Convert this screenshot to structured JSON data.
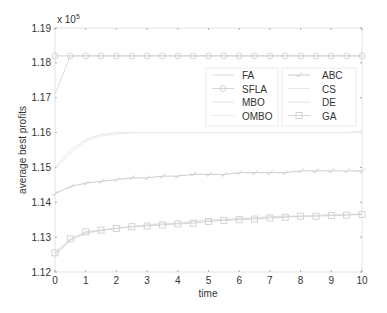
{
  "chart_data": {
    "type": "line",
    "title": "",
    "xlabel": "time",
    "ylabel": "average best profits",
    "y_exponent_label": "x 10",
    "y_exponent_power": "5",
    "xlim": [
      0,
      10
    ],
    "ylim": [
      1.12,
      1.19
    ],
    "xticks": [
      0,
      1,
      2,
      3,
      4,
      5,
      6,
      7,
      8,
      9,
      10
    ],
    "yticks": [
      1.12,
      1.13,
      1.14,
      1.15,
      1.16,
      1.17,
      1.18,
      1.19
    ],
    "ytick_labels": [
      "1.12",
      "1.13",
      "1.14",
      "1.15",
      "1.16",
      "1.17",
      "1.18",
      "1.19"
    ],
    "xtick_labels": [
      "0",
      "1",
      "2",
      "3",
      "4",
      "5",
      "6",
      "7",
      "8",
      "9",
      "10"
    ],
    "grid": false,
    "legend_placement": "top-right",
    "legend_columns": [
      [
        "FA",
        "SFLA",
        "MBO",
        "OMBO"
      ],
      [
        "ABC",
        "CS",
        "DE",
        "GA"
      ]
    ],
    "x": [
      0,
      0.5,
      1,
      1.5,
      2,
      2.5,
      3,
      3.5,
      4,
      4.5,
      5,
      5.5,
      6,
      6.5,
      7,
      7.5,
      8,
      8.5,
      9,
      9.5,
      10
    ],
    "series": [
      {
        "name": "FA",
        "marker": "none",
        "color": "#d8d8d8",
        "values": [
          1.171,
          1.182,
          1.182,
          1.182,
          1.182,
          1.182,
          1.182,
          1.182,
          1.182,
          1.182,
          1.182,
          1.182,
          1.182,
          1.182,
          1.182,
          1.182,
          1.182,
          1.182,
          1.182,
          1.182,
          1.182
        ]
      },
      {
        "name": "SFLA",
        "marker": "circle",
        "color": "#cfcfcf",
        "values": [
          1.182,
          1.182,
          1.182,
          1.182,
          1.182,
          1.182,
          1.182,
          1.182,
          1.182,
          1.182,
          1.182,
          1.182,
          1.182,
          1.182,
          1.182,
          1.182,
          1.182,
          1.182,
          1.182,
          1.182,
          1.182
        ]
      },
      {
        "name": "MBO",
        "marker": "none",
        "color": "#e2e2e2",
        "values": [
          1.15,
          1.155,
          1.158,
          1.1595,
          1.16,
          1.16,
          1.16,
          1.16,
          1.16,
          1.16,
          1.16,
          1.16,
          1.16,
          1.16,
          1.16,
          1.16,
          1.16,
          1.16,
          1.16,
          1.16,
          1.1605
        ]
      },
      {
        "name": "OMBO",
        "marker": "none",
        "color": "#e8e8e8",
        "values": [
          1.1495,
          1.154,
          1.1575,
          1.159,
          1.1595,
          1.16,
          1.16,
          1.16,
          1.16,
          1.16,
          1.16,
          1.16,
          1.16,
          1.16,
          1.16,
          1.16,
          1.16,
          1.16,
          1.16,
          1.16,
          1.16
        ]
      },
      {
        "name": "ABC",
        "marker": "check",
        "color": "#c8c8c8",
        "values": [
          1.1425,
          1.1445,
          1.1455,
          1.146,
          1.1465,
          1.147,
          1.147,
          1.1475,
          1.1475,
          1.148,
          1.148,
          1.148,
          1.1485,
          1.1485,
          1.1485,
          1.1485,
          1.149,
          1.149,
          1.149,
          1.149,
          1.149
        ]
      },
      {
        "name": "CS",
        "marker": "none",
        "color": "#e6e6e6",
        "values": [
          1.1245,
          1.129,
          1.131,
          1.1318,
          1.1325,
          1.133,
          1.1335,
          1.134,
          1.134,
          1.1345,
          1.135,
          1.135,
          1.1355,
          1.1355,
          1.136,
          1.136,
          1.136,
          1.1362,
          1.1365,
          1.1365,
          1.1368
        ]
      },
      {
        "name": "DE",
        "marker": "none",
        "color": "#e0e0e0",
        "values": [
          1.125,
          1.1292,
          1.1312,
          1.132,
          1.1325,
          1.133,
          1.1335,
          1.1338,
          1.134,
          1.1345,
          1.1348,
          1.135,
          1.1352,
          1.1355,
          1.1358,
          1.136,
          1.136,
          1.1362,
          1.1363,
          1.1365,
          1.1366
        ]
      },
      {
        "name": "GA",
        "marker": "square",
        "color": "#d0d0d0",
        "values": [
          1.1255,
          1.1295,
          1.1315,
          1.132,
          1.1325,
          1.133,
          1.1332,
          1.1335,
          1.1338,
          1.134,
          1.1345,
          1.1348,
          1.135,
          1.1352,
          1.1355,
          1.1357,
          1.136,
          1.136,
          1.1362,
          1.1363,
          1.1365
        ]
      }
    ]
  }
}
